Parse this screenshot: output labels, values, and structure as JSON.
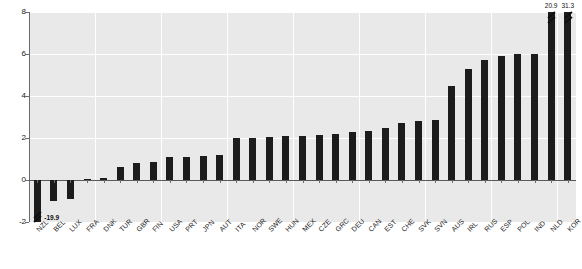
{
  "chart_data": {
    "type": "bar",
    "title": "",
    "subtitle": "",
    "xlabel": "",
    "ylabel": "",
    "ylim": [
      -2,
      8
    ],
    "yticks": [
      -2,
      0,
      2,
      4,
      6,
      8
    ],
    "ytick_labels": [
      "-2",
      "0",
      "2",
      "4",
      "6",
      "8"
    ],
    "grid": true,
    "legend": "none",
    "bar_color": "#1c1c1c",
    "plot_background": "#e9e9e9",
    "gridline_color": "#ffffff",
    "categories": [
      "NZL",
      "BEL",
      "LUX",
      "FRA",
      "DNK",
      "TUR",
      "GBR",
      "FIN",
      "USA",
      "PRT",
      "JPN",
      "AUT",
      "ITA",
      "NOR",
      "SWE",
      "HUN",
      "MEX",
      "CZE",
      "GRC",
      "DEU",
      "CAN",
      "EST",
      "CHE",
      "SVK",
      "SVN",
      "AUS",
      "IRL",
      "RUS",
      "ESP",
      "POL",
      "IND",
      "NLD",
      "KOR"
    ],
    "values": [
      -19.9,
      -1.0,
      -0.9,
      0.03,
      0.1,
      0.6,
      0.8,
      0.85,
      1.1,
      1.1,
      1.15,
      1.2,
      2.0,
      2.0,
      2.05,
      2.1,
      2.1,
      2.15,
      2.2,
      2.3,
      2.35,
      2.5,
      2.7,
      2.8,
      2.85,
      4.5,
      5.3,
      5.7,
      5.9,
      6.0,
      6.0,
      20.9,
      31.3
    ],
    "clipped_bars": [
      {
        "category": "NZL",
        "value": -19.9,
        "label": "-19.9",
        "direction": "down"
      },
      {
        "category": "NLD",
        "value": 20.9,
        "label": "20.9",
        "direction": "up"
      },
      {
        "category": "KOR",
        "value": 31.3,
        "label": "31.3",
        "direction": "up"
      }
    ],
    "annotations": [
      "-19.9",
      "20.9",
      "31.3"
    ]
  }
}
